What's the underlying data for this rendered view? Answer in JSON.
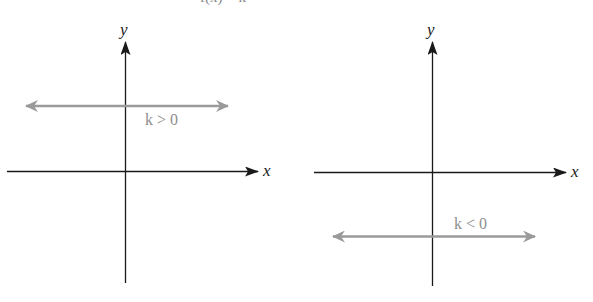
{
  "header": {
    "clipped_text": "f(x) = k"
  },
  "colors": {
    "axis": "#1a1a1a",
    "function_line": "#9a9a9a",
    "label_gray": "#8e8e8e",
    "background": "#ffffff"
  },
  "graphs": [
    {
      "id": "left",
      "x_axis_label": "x",
      "y_axis_label": "y",
      "condition_label": "k > 0",
      "line_position": "above x-axis"
    },
    {
      "id": "right",
      "x_axis_label": "x",
      "y_axis_label": "y",
      "condition_label": "k < 0",
      "line_position": "below x-axis"
    }
  ]
}
